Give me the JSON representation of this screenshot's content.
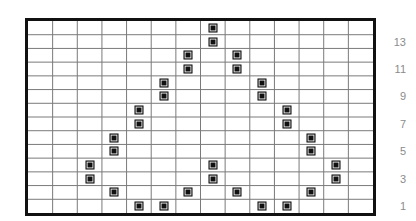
{
  "chart_data": {
    "type": "scatter",
    "title": "",
    "subtitle": "",
    "xlabel": "",
    "ylabel": "",
    "grid": true,
    "legend": null,
    "legend_position": "none",
    "xlim": [
      0,
      14
    ],
    "ylim": [
      0,
      14
    ],
    "n_cols": 14,
    "n_rows": 14,
    "x_tick_labels": [],
    "y_tick_labels": [
      "13",
      "11",
      "9",
      "7",
      "5",
      "3",
      "1"
    ],
    "y_tick_values": [
      13,
      11,
      9,
      7,
      5,
      3,
      1
    ],
    "marker_style": "filled-square",
    "marker_color": "#111111",
    "grid_color": "#7a7a7a",
    "frame_color": "#111111",
    "label_color": "#8b8b8b",
    "background": "#ffffff",
    "note": "Stitch / knitting chart: each filled cell is a marked stitch forming a symmetric chevron (pyramid) motif.",
    "points": [
      {
        "col": 8,
        "row": 14
      },
      {
        "col": 8,
        "row": 13
      },
      {
        "col": 7,
        "row": 12
      },
      {
        "col": 9,
        "row": 12
      },
      {
        "col": 7,
        "row": 11
      },
      {
        "col": 9,
        "row": 11
      },
      {
        "col": 6,
        "row": 10
      },
      {
        "col": 10,
        "row": 10
      },
      {
        "col": 6,
        "row": 9
      },
      {
        "col": 10,
        "row": 9
      },
      {
        "col": 5,
        "row": 8
      },
      {
        "col": 11,
        "row": 8
      },
      {
        "col": 5,
        "row": 7
      },
      {
        "col": 11,
        "row": 7
      },
      {
        "col": 4,
        "row": 6
      },
      {
        "col": 12,
        "row": 6
      },
      {
        "col": 4,
        "row": 5
      },
      {
        "col": 12,
        "row": 5
      },
      {
        "col": 3,
        "row": 4
      },
      {
        "col": 8,
        "row": 4
      },
      {
        "col": 13,
        "row": 4
      },
      {
        "col": 3,
        "row": 3
      },
      {
        "col": 8,
        "row": 3
      },
      {
        "col": 13,
        "row": 3
      },
      {
        "col": 4,
        "row": 2
      },
      {
        "col": 7,
        "row": 2
      },
      {
        "col": 9,
        "row": 2
      },
      {
        "col": 12,
        "row": 2
      },
      {
        "col": 5,
        "row": 1
      },
      {
        "col": 6,
        "row": 1
      },
      {
        "col": 10,
        "row": 1
      },
      {
        "col": 11,
        "row": 1
      }
    ]
  }
}
